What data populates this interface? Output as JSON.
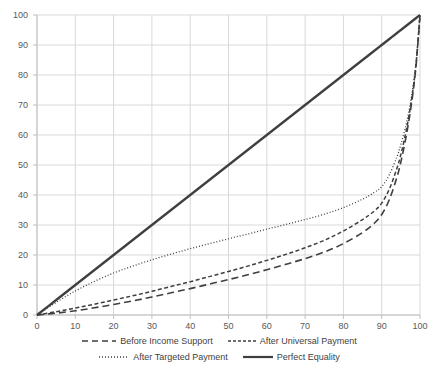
{
  "chart_data": {
    "type": "line",
    "title": "",
    "xlabel": "",
    "ylabel": "",
    "xlim": [
      0,
      100
    ],
    "ylim": [
      0,
      100
    ],
    "xticks": [
      0,
      10,
      20,
      30,
      40,
      50,
      60,
      70,
      80,
      90,
      100
    ],
    "yticks": [
      0,
      10,
      20,
      30,
      40,
      50,
      60,
      70,
      80,
      90,
      100
    ],
    "grid": true,
    "legend_position": "bottom",
    "x": [
      0,
      5,
      10,
      15,
      20,
      25,
      30,
      35,
      40,
      45,
      50,
      55,
      60,
      65,
      70,
      75,
      80,
      85,
      88,
      90,
      92,
      94,
      95,
      96,
      97,
      98,
      99,
      100
    ],
    "series": [
      {
        "name": "Before Income Support",
        "style": "long-dash",
        "color": "#3f3f3f",
        "values": [
          0,
          0.6,
          1.4,
          2.4,
          3.5,
          4.7,
          6.0,
          7.4,
          8.8,
          10.3,
          11.8,
          13.4,
          15.1,
          16.9,
          18.8,
          21.0,
          23.8,
          27.5,
          30.5,
          33.5,
          38.5,
          46.0,
          51.0,
          57.0,
          64.0,
          72.5,
          83.5,
          100
        ]
      },
      {
        "name": "After Universal Payment",
        "style": "short-dash",
        "color": "#3f3f3f",
        "values": [
          0,
          1.1,
          2.3,
          3.6,
          5.0,
          6.4,
          7.9,
          9.5,
          11.1,
          12.8,
          14.5,
          16.3,
          18.2,
          20.2,
          22.4,
          24.9,
          28.0,
          31.8,
          34.6,
          37.3,
          42.0,
          49.0,
          53.5,
          59.0,
          65.5,
          73.5,
          84.0,
          100
        ]
      },
      {
        "name": "After Targeted Payment",
        "style": "dotted",
        "color": "#3f3f3f",
        "values": [
          0,
          4.2,
          8.0,
          11.2,
          14.0,
          16.3,
          18.4,
          20.3,
          22.1,
          23.8,
          25.4,
          27.0,
          28.6,
          30.2,
          31.8,
          33.6,
          35.8,
          38.6,
          40.8,
          42.8,
          46.8,
          52.8,
          56.8,
          61.5,
          67.2,
          74.5,
          84.5,
          100
        ]
      },
      {
        "name": "Perfect Equality",
        "style": "solid",
        "color": "#3f3f3f",
        "values": [
          0,
          5,
          10,
          15,
          20,
          25,
          30,
          35,
          40,
          45,
          50,
          55,
          60,
          65,
          70,
          75,
          80,
          85,
          88,
          90,
          92,
          94,
          95,
          96,
          97,
          98,
          99,
          100
        ]
      }
    ]
  },
  "axes": {
    "x_tick_labels": [
      "0",
      "10",
      "20",
      "30",
      "40",
      "50",
      "60",
      "70",
      "80",
      "90",
      "100"
    ],
    "y_tick_labels": [
      "0",
      "10",
      "20",
      "30",
      "40",
      "50",
      "60",
      "70",
      "80",
      "90",
      "100"
    ]
  },
  "legend": {
    "row1": [
      {
        "label": "Before Income Support",
        "style": "long-dash"
      },
      {
        "label": "After Universal Payment",
        "style": "short-dash"
      }
    ],
    "row2": [
      {
        "label": "After Targeted Payment",
        "style": "dotted"
      },
      {
        "label": "Perfect Equality",
        "style": "solid"
      }
    ]
  },
  "colors": {
    "line": "#3f3f3f",
    "grid": "#d9d9d9",
    "axis": "#bfbfbf",
    "text": "#595959"
  }
}
